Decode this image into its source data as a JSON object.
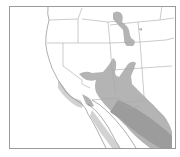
{
  "map": {
    "region": "Western United States and Northern Mexico",
    "style": "grayscale range map",
    "colors": {
      "background": "#ffffff",
      "frame": "#9a9a9a",
      "borders": "#a8a8a8",
      "range_primary": "#b4b4b4",
      "range_dense": "#9c9c9c",
      "range_light": "#d2d2d2"
    },
    "frame": {
      "x": 9,
      "y": 6,
      "width": 167,
      "height": 143
    },
    "layers": [
      {
        "name": "state-borders",
        "type": "lines"
      },
      {
        "name": "coastline",
        "type": "lines"
      },
      {
        "name": "range-northern-patch",
        "type": "polygon",
        "location": "Wyoming / Colorado"
      },
      {
        "name": "range-southwest-main",
        "type": "polygon",
        "location": "Arizona / New Mexico / Sonora / Chihuahua"
      },
      {
        "name": "range-coastal-california",
        "type": "polygon",
        "location": "Southern California / Baja"
      },
      {
        "name": "range-mexico-dense",
        "type": "polygon",
        "location": "Sierra Madre Occidental"
      }
    ]
  }
}
